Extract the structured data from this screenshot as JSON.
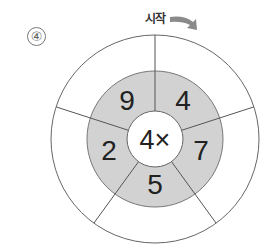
{
  "problem": {
    "number_label": "④"
  },
  "start": {
    "label": "시작",
    "arrow_direction": "clockwise"
  },
  "wheel": {
    "center_label": "4×",
    "operation": "multiply",
    "multiplier": 4,
    "inner_ring_values": [
      "4",
      "7",
      "5",
      "2",
      "9"
    ],
    "outer_ring_values": [
      "",
      "",
      "",
      "",
      ""
    ],
    "colors": {
      "inner_ring_fill": "#d2d2d2",
      "stroke": "#666666",
      "arrow": "#8a8a8a"
    }
  }
}
